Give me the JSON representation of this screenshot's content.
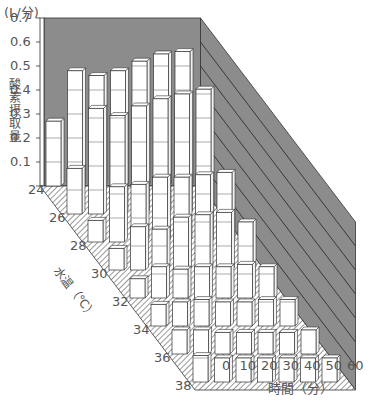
{
  "chart_data": {
    "type": "bar3d",
    "title": "",
    "ylabel": "酸素摂取量",
    "yunit": "(L/分)",
    "xlabel": "時間（分）",
    "zlabel": "水温（℃）",
    "ylim": [
      0,
      0.7
    ],
    "yticks": [
      "0.7",
      "0.6",
      "0.5",
      "0.4",
      "0.3",
      "0.2",
      "0.1"
    ],
    "x": [
      "0",
      "10",
      "20",
      "30",
      "40",
      "50",
      "60"
    ],
    "temps": [
      "24",
      "26",
      "28",
      "30",
      "32",
      "34",
      "36",
      "38"
    ],
    "series": [
      {
        "name": "24",
        "values": [
          0.27,
          0.48,
          0.46,
          0.48,
          0.52,
          0.55,
          0.56
        ]
      },
      {
        "name": "26",
        "values": [
          0.19,
          0.44,
          0.41,
          0.45,
          0.48,
          0.5,
          0.52
        ]
      },
      {
        "name": "28",
        "values": [
          0.09,
          0.23,
          0.24,
          0.27,
          0.27,
          0.28,
          0.29
        ]
      },
      {
        "name": "30",
        "values": [
          0.09,
          0.18,
          0.17,
          0.22,
          0.23,
          0.24,
          0.2
        ]
      },
      {
        "name": "32",
        "values": [
          0.08,
          0.13,
          0.12,
          0.13,
          0.13,
          0.14,
          0.13
        ]
      },
      {
        "name": "34",
        "values": [
          0.09,
          0.1,
          0.11,
          0.1,
          0.1,
          0.11,
          0.11
        ]
      },
      {
        "name": "36",
        "values": [
          0.1,
          0.1,
          0.09,
          0.09,
          0.09,
          0.09,
          0.1
        ]
      },
      {
        "name": "38",
        "values": [
          0.11,
          0.1,
          0.1,
          0.1,
          0.1,
          0.1,
          0.1
        ]
      }
    ],
    "colors": {
      "wall": "#8c8c8c",
      "bar": "#ffffff",
      "edge": "#333333",
      "floor_hatch": "#555555"
    }
  }
}
